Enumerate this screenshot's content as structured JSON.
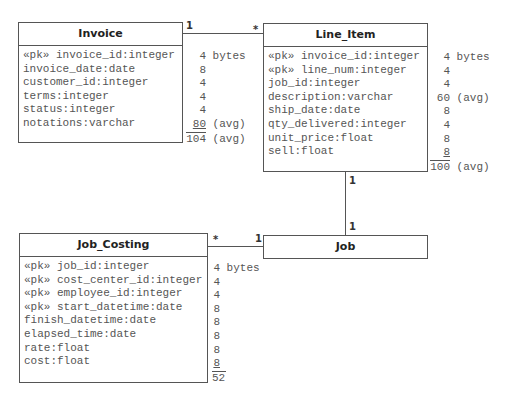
{
  "entities": {
    "invoice": {
      "name": "Invoice",
      "attributes": [
        "«pk» invoice_id:integer",
        "invoice_date:date",
        "customer_id:integer",
        "terms:integer",
        "status:integer",
        "notations:varchar"
      ],
      "sizes": [
        "4",
        "8",
        "4",
        "4",
        "4",
        "80"
      ],
      "size_notes": [
        "bytes",
        "",
        "",
        "",
        "",
        "(avg)"
      ],
      "total": "104",
      "total_note": "(avg)"
    },
    "line_item": {
      "name": "Line_Item",
      "attributes": [
        "«pk» invoice_id:integer",
        "«pk» line_num:integer",
        "job_id:integer",
        "description:varchar",
        "ship_date:date",
        "qty_delivered:integer",
        "unit_price:float",
        "sell:float"
      ],
      "sizes": [
        "4",
        "4",
        "4",
        "60",
        "8",
        "4",
        "8",
        "8"
      ],
      "size_notes": [
        "bytes",
        "",
        "",
        "(avg)",
        "",
        "",
        "",
        ""
      ],
      "total": "100",
      "total_note": "(avg)"
    },
    "job_costing": {
      "name": "Job_Costing",
      "attributes": [
        "«pk» job_id:integer",
        "«pk» cost_center_id:integer",
        "«pk» employee_id:integer",
        "«pk» start_datetime:date",
        "finish_datetime:date",
        "elapsed_time:date",
        "rate:float",
        "cost:float"
      ],
      "sizes": [
        "4",
        "4",
        "4",
        "8",
        "8",
        "8",
        "8",
        "8"
      ],
      "size_notes": [
        "bytes",
        "",
        "",
        "",
        "",
        "",
        "",
        ""
      ],
      "total": "52",
      "total_note": ""
    },
    "job": {
      "name": "Job"
    }
  },
  "relationships": [
    {
      "from": "Invoice",
      "to": "Line_Item",
      "from_mult": "1",
      "to_mult": "*"
    },
    {
      "from": "Line_Item",
      "to": "Job",
      "from_mult": "1",
      "to_mult": "1"
    },
    {
      "from": "Job_Costing",
      "to": "Job",
      "from_mult": "*",
      "to_mult": "1"
    }
  ]
}
